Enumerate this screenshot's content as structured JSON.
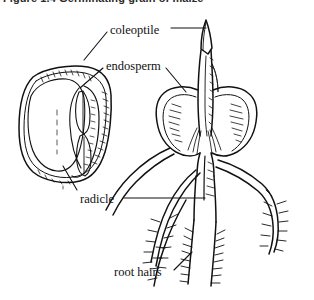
{
  "figure": {
    "caption": "Figure 1.4 Germinating grain of maize",
    "style": "black-and-white line drawing",
    "background_color": "#ffffff",
    "ink_color": "#111111"
  },
  "labels": [
    {
      "id": "coleoptile",
      "text": "coleoptile",
      "x": 110,
      "y": 24
    },
    {
      "id": "endosperm",
      "text": "endosperm",
      "x": 106,
      "y": 60
    },
    {
      "id": "radicle",
      "text": "radicle",
      "x": 80,
      "y": 193
    },
    {
      "id": "root_hairs",
      "text": "root hairs",
      "x": 114,
      "y": 266
    }
  ],
  "illustrations": [
    {
      "id": "cut-seed",
      "name": "cut-away maize grain",
      "position": "left",
      "parts_shown": [
        "endosperm",
        "embryo",
        "coleoptile",
        "radicle"
      ]
    },
    {
      "id": "seedling",
      "name": "germinating maize seedling",
      "position": "right",
      "parts_shown": [
        "coleoptile",
        "endosperm",
        "radicle",
        "seminal roots",
        "root hairs"
      ]
    }
  ]
}
